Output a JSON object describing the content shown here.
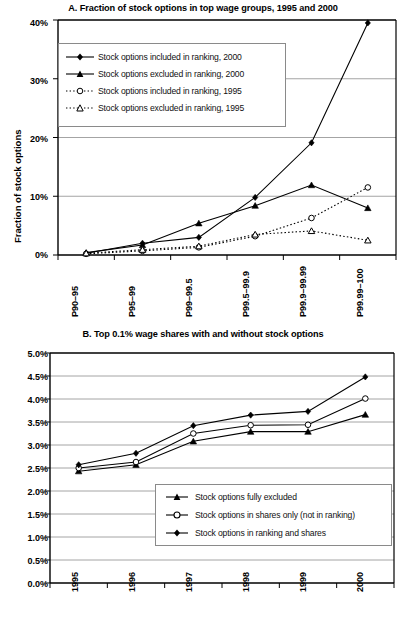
{
  "figure": {
    "panelA": {
      "title": "A. Fraction of stock options in top wage groups, 1995 and 2000",
      "ylabel": "Fraction of stock options",
      "yticks": [
        "0%",
        "10%",
        "20%",
        "30%",
        "40%"
      ],
      "xticks": [
        "P90–95",
        "P95–99",
        "P99–99.5",
        "P99.5–99.9",
        "P99.9–99.99",
        "P99.99–100"
      ],
      "legend": [
        "Stock options included in ranking, 2000",
        "Stock options excluded in ranking, 2000",
        "Stock options included in ranking, 1995",
        "Stock options excluded in ranking, 1995"
      ]
    },
    "panelB": {
      "title": "B. Top 0.1% wage shares with and without stock options",
      "yticks": [
        "0.0%",
        "0.5%",
        "1.0%",
        "1.5%",
        "2.0%",
        "2.5%",
        "3.0%",
        "3.5%",
        "4.0%",
        "4.5%",
        "5.0%"
      ],
      "xticks": [
        "1995",
        "1996",
        "1997",
        "1998",
        "1999",
        "2000"
      ],
      "legend": [
        "Stock options fully excluded",
        "Stock options in shares only (not in ranking)",
        "Stock options in ranking and shares"
      ]
    }
  },
  "chart_data": [
    {
      "id": "panel-a",
      "type": "line",
      "title": "A. Fraction of stock options in top wage groups, 1995 and 2000",
      "xlabel": "",
      "ylabel": "Fraction of stock options",
      "categories": [
        "P90–95",
        "P95–99",
        "P99–99.5",
        "P99.5–99.9",
        "P99.9–99.99",
        "P99.99–100"
      ],
      "ylim": [
        0,
        40
      ],
      "ytick_values": [
        0,
        10,
        20,
        30,
        40
      ],
      "grid": true,
      "legend_position": "upper-left",
      "series": [
        {
          "name": "Stock options included in ranking, 2000",
          "marker": "filled-diamond",
          "line": "solid",
          "values": [
            0.3,
            2.0,
            3.0,
            9.8,
            19.1,
            39.5
          ]
        },
        {
          "name": "Stock options excluded in ranking, 2000",
          "marker": "filled-triangle",
          "line": "solid",
          "values": [
            0.4,
            1.7,
            5.4,
            8.4,
            11.9,
            8.0
          ]
        },
        {
          "name": "Stock options included in ranking, 1995",
          "marker": "open-circle",
          "line": "dotted",
          "values": [
            0.2,
            0.7,
            1.3,
            3.2,
            6.3,
            11.5
          ]
        },
        {
          "name": "Stock options excluded in ranking, 1995",
          "marker": "open-triangle",
          "line": "dotted",
          "values": [
            0.3,
            0.9,
            1.5,
            3.5,
            4.1,
            2.5
          ]
        }
      ]
    },
    {
      "id": "panel-b",
      "type": "line",
      "title": "B. Top 0.1% wage shares with and without stock options",
      "xlabel": "",
      "ylabel": "",
      "categories": [
        "1995",
        "1996",
        "1997",
        "1998",
        "1999",
        "2000"
      ],
      "ylim": [
        0.0,
        5.0
      ],
      "ytick_values": [
        0.0,
        0.5,
        1.0,
        1.5,
        2.0,
        2.5,
        3.0,
        3.5,
        4.0,
        4.5,
        5.0
      ],
      "grid": true,
      "legend_position": "lower-right",
      "series": [
        {
          "name": "Stock options fully excluded",
          "marker": "filled-triangle",
          "line": "solid",
          "values": [
            2.43,
            2.57,
            3.08,
            3.29,
            3.29,
            3.66
          ]
        },
        {
          "name": "Stock options in shares only (not in ranking)",
          "marker": "open-circle",
          "line": "solid",
          "values": [
            2.5,
            2.63,
            3.25,
            3.43,
            3.44,
            4.01
          ]
        },
        {
          "name": "Stock options in ranking and shares",
          "marker": "filled-diamond",
          "line": "solid",
          "values": [
            2.57,
            2.82,
            3.42,
            3.65,
            3.73,
            4.48
          ]
        }
      ]
    }
  ]
}
